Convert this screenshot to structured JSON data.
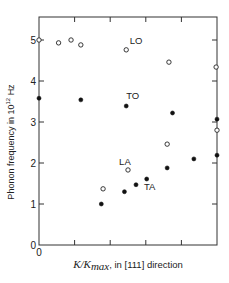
{
  "chart_data": {
    "type": "scatter",
    "title": "",
    "xlabel": "K/K_max, in [111] direction",
    "xlabel_parts": {
      "italic": "K/K",
      "subscript": "max",
      "rest": ", in [111] direction"
    },
    "ylabel": "Phonon frequency in 10^12 Hz",
    "ylabel_parts": {
      "pre": "Phonon frequency in 10",
      "sup": "12",
      "post": " Hz"
    },
    "xlim": [
      0,
      1.0
    ],
    "ylim": [
      0,
      5.5
    ],
    "x_ticks": [
      0,
      0.2,
      0.4,
      0.6,
      0.8,
      1.0
    ],
    "x_tick_labels": [
      "0",
      "",
      "",
      "",
      "",
      ""
    ],
    "y_ticks": [
      0,
      1,
      2,
      3,
      4,
      5
    ],
    "y_tick_labels": [
      "0",
      "1",
      "2",
      "3",
      "4",
      "5"
    ],
    "grid": false,
    "legend": "none (inline labels)",
    "series": [
      {
        "name": "LO",
        "marker": "open-circle",
        "label_pos": {
          "x": 0.51,
          "y": 4.9
        },
        "points": [
          [
            0.0,
            5.0
          ],
          [
            0.11,
            4.93
          ],
          [
            0.18,
            5.0
          ],
          [
            0.235,
            4.88
          ],
          [
            0.49,
            4.76
          ],
          [
            0.73,
            4.46
          ],
          [
            0.995,
            4.34
          ]
        ]
      },
      {
        "name": "TO",
        "marker": "filled-circle",
        "label_pos": {
          "x": 0.49,
          "y": 3.57
        },
        "points": [
          [
            0.0,
            3.58
          ],
          [
            0.235,
            3.54
          ],
          [
            0.49,
            3.39
          ],
          [
            0.75,
            3.22
          ],
          [
            1.0,
            3.07
          ]
        ]
      },
      {
        "name": "LA",
        "marker": "open-circle",
        "label_pos": {
          "x": 0.45,
          "y": 1.95
        },
        "points": [
          [
            0.36,
            1.37
          ],
          [
            0.5,
            1.83
          ],
          [
            0.72,
            2.46
          ],
          [
            1.0,
            2.8
          ]
        ]
      },
      {
        "name": "TA",
        "marker": "filled-circle",
        "label_pos": {
          "x": 0.59,
          "y": 1.35
        },
        "points": [
          [
            0.35,
            1.0
          ],
          [
            0.48,
            1.3
          ],
          [
            0.545,
            1.47
          ],
          [
            0.605,
            1.61
          ],
          [
            0.72,
            1.88
          ],
          [
            0.87,
            2.1
          ],
          [
            1.0,
            2.19
          ]
        ]
      }
    ]
  }
}
